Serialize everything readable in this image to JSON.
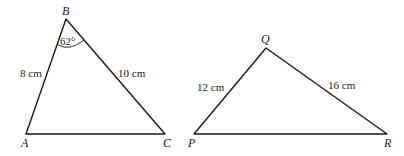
{
  "diagram": {
    "triangles": [
      {
        "name": "ABC",
        "vertices": {
          "A": {
            "label": "A",
            "x": 26,
            "y": 134
          },
          "B": {
            "label": "B",
            "x": 66,
            "y": 19
          },
          "C": {
            "label": "C",
            "x": 165,
            "y": 134
          }
        },
        "sides": {
          "AB": {
            "label": "8 cm"
          },
          "BC": {
            "label": "10 cm"
          }
        },
        "angles": {
          "B": {
            "label": "62°"
          }
        }
      },
      {
        "name": "PQR",
        "vertices": {
          "P": {
            "label": "P",
            "x": 194,
            "y": 134
          },
          "Q": {
            "label": "Q",
            "x": 266,
            "y": 48
          },
          "R": {
            "label": "R",
            "x": 387,
            "y": 134
          }
        },
        "sides": {
          "PQ": {
            "label": "12 cm"
          },
          "QR": {
            "label": "16 cm"
          }
        }
      }
    ]
  }
}
